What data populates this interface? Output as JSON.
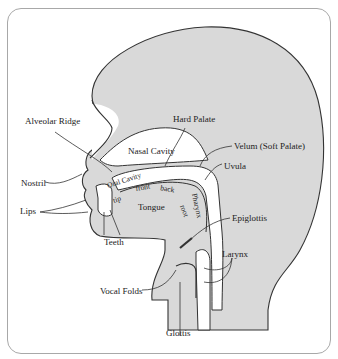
{
  "diagram": {
    "colors": {
      "tissue": "#d9d9d9",
      "outline": "#333333",
      "background": "#ffffff",
      "frame": "#a8a8a8"
    },
    "labels": {
      "alveolar_ridge": "Alveolar Ridge",
      "hard_palate": "Hard Palate",
      "nasal_cavity": "Nasal Cavity",
      "velum": "Velum (Soft Palate)",
      "uvula": "Uvula",
      "nostril": "Nostril",
      "oral_cavity": "Oral Cavity",
      "tip": "tip",
      "front": "front",
      "back": "back",
      "root": "root",
      "pharynx": "Pharynx",
      "tongue": "Tongue",
      "lips": "Lips",
      "teeth": "Teeth",
      "epiglottis": "Epiglottis",
      "larynx": "Larynx",
      "vocal_folds": "Vocal Folds",
      "glottis": "Glottis"
    }
  }
}
